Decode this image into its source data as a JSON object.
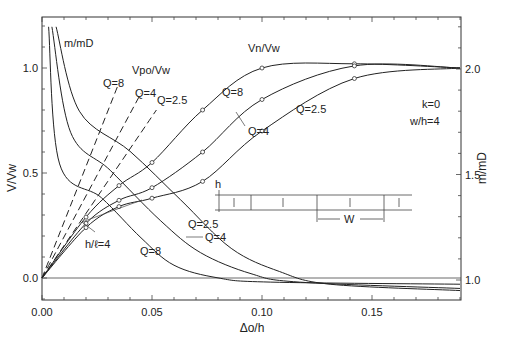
{
  "chart_data": {
    "type": "line",
    "title": "",
    "xlabel": "Δo/h",
    "ylabel": "V/Vw",
    "ylabel_right": "m/mD",
    "xlim": [
      0.0,
      0.19
    ],
    "ylim": [
      -0.1,
      1.2
    ],
    "ylim_right": [
      0.9,
      2.2
    ],
    "x_ticks": [
      "0.00",
      "0.05",
      "0.10",
      "0.15"
    ],
    "y_ticks": [
      "0.0",
      "0.5",
      "1.0"
    ],
    "y_ticks_right": [
      "1.0",
      "1.5",
      "2.0"
    ],
    "grid": false,
    "annotations": {
      "mmD_label": "m/mD",
      "vpo_label": "Vpo/Vw",
      "vn_label": "Vn/Vw",
      "params": [
        "k=0",
        "w/h=4"
      ],
      "hl_label": "h/ℓ=4",
      "inset_h": "h",
      "inset_w": "W"
    },
    "series": [
      {
        "name": "m/mD Q=8",
        "axis": "right",
        "x": [
          0.003,
          0.008,
          0.027,
          0.045,
          0.06,
          0.08,
          0.104,
          0.19
        ],
        "values": [
          2.2,
          1.55,
          1.39,
          1.2,
          1.07,
          1.01,
          0.99,
          0.98
        ]
      },
      {
        "name": "m/mD Q=4",
        "axis": "right",
        "x": [
          0.0045,
          0.013,
          0.031,
          0.054,
          0.072,
          0.095,
          0.117,
          0.19
        ],
        "values": [
          2.2,
          1.7,
          1.52,
          1.28,
          1.13,
          1.03,
          0.99,
          0.96
        ]
      },
      {
        "name": "m/mD Q=2.5",
        "axis": "right",
        "x": [
          0.0064,
          0.017,
          0.04,
          0.063,
          0.086,
          0.108,
          0.131,
          0.19
        ],
        "values": [
          2.2,
          1.8,
          1.61,
          1.38,
          1.15,
          1.04,
          0.98,
          0.95
        ]
      },
      {
        "name": "Vpo/Vw Q=8",
        "axis": "left",
        "style": "dashed",
        "x": [
          0.0,
          0.035
        ],
        "values": [
          0.0,
          0.93
        ]
      },
      {
        "name": "Vpo/Vw Q=4",
        "axis": "left",
        "style": "dashed",
        "x": [
          0.0,
          0.045
        ],
        "values": [
          0.0,
          0.88
        ]
      },
      {
        "name": "Vpo/Vw Q=2.5",
        "axis": "left",
        "style": "dashed",
        "x": [
          0.0,
          0.052
        ],
        "values": [
          0.0,
          0.8
        ]
      },
      {
        "name": "Vn/Vw Q=8",
        "axis": "left",
        "x": [
          0.0,
          0.02,
          0.035,
          0.05,
          0.073,
          0.1,
          0.142,
          0.19
        ],
        "values": [
          0.0,
          0.29,
          0.44,
          0.55,
          0.8,
          1.0,
          1.02,
          1.0
        ]
      },
      {
        "name": "Vn/Vw Q=4",
        "axis": "left",
        "x": [
          0.0,
          0.02,
          0.035,
          0.05,
          0.073,
          0.1,
          0.142,
          0.19
        ],
        "values": [
          0.0,
          0.26,
          0.37,
          0.43,
          0.6,
          0.85,
          1.01,
          1.0
        ]
      },
      {
        "name": "Vn/Vw Q=2.5",
        "axis": "left",
        "x": [
          0.0,
          0.02,
          0.035,
          0.05,
          0.073,
          0.1,
          0.142,
          0.19
        ],
        "values": [
          0.0,
          0.24,
          0.34,
          0.38,
          0.46,
          0.7,
          0.95,
          1.0
        ]
      }
    ],
    "curve_labels": {
      "vpo": [
        "Q=8",
        "Q=4",
        "Q=2.5"
      ],
      "vn": [
        "Q=8",
        "Q=4",
        "Q=2.5"
      ],
      "mmd": [
        "Q=8",
        "Q=4",
        "Q=2.5"
      ]
    }
  }
}
